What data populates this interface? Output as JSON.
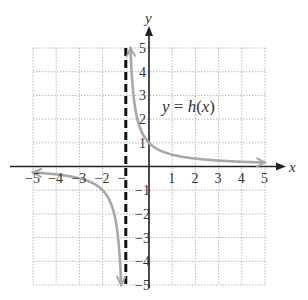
{
  "chart_data": {
    "type": "line",
    "title": "",
    "function_label": "y = h(x)",
    "xlabel": "x",
    "ylabel": "y",
    "xlim": [
      -5,
      5
    ],
    "ylim": [
      -5,
      5
    ],
    "grid": true,
    "grid_style": "dotted",
    "x_tick_labels": [
      "-5",
      "-4",
      "-3",
      "-2",
      "-",
      "1",
      "2",
      "3",
      "4",
      "5"
    ],
    "y_tick_labels": [
      "5",
      "4",
      "3",
      "2",
      "1",
      "-1",
      "-2",
      "-3",
      "-4",
      "-5"
    ],
    "vertical_asymptote": {
      "x": -1,
      "style": "dashed"
    },
    "horizontal_asymptote": {
      "y": 0
    },
    "series": [
      {
        "name": "h(x) right branch",
        "x": [
          -0.8,
          -0.7,
          -0.5,
          -0.25,
          0,
          0.5,
          1,
          2,
          3,
          4,
          5
        ],
        "y": [
          5,
          3.33,
          2,
          1.33,
          1,
          0.67,
          0.5,
          0.33,
          0.25,
          0.2,
          0.17
        ]
      },
      {
        "name": "h(x) left branch",
        "x": [
          -5,
          -4,
          -3,
          -2,
          -1.5,
          -1.25,
          -1.2
        ],
        "y": [
          -0.25,
          -0.33,
          -0.5,
          -1,
          -2,
          -4,
          -5
        ]
      }
    ],
    "colors": {
      "curve": "#a8a8a8",
      "axes": "#222222",
      "asymptote": "#111111",
      "grid": "#b8b8b8"
    }
  },
  "labels": {
    "x_axis": "x",
    "y_axis": "y",
    "function": "y = h(x)",
    "xticks": [
      {
        "v": -5,
        "t": "−5"
      },
      {
        "v": -4,
        "t": "−4"
      },
      {
        "v": -3,
        "t": "−3"
      },
      {
        "v": -2,
        "t": "−2"
      },
      {
        "v": -1,
        "t": "−"
      },
      {
        "v": 1,
        "t": "1"
      },
      {
        "v": 2,
        "t": "2"
      },
      {
        "v": 3,
        "t": "3"
      },
      {
        "v": 4,
        "t": "4"
      },
      {
        "v": 5,
        "t": "5"
      }
    ],
    "yticks": [
      {
        "v": 5,
        "t": "5"
      },
      {
        "v": 4,
        "t": "4"
      },
      {
        "v": 3,
        "t": "3"
      },
      {
        "v": 2,
        "t": "2"
      },
      {
        "v": 1,
        "t": "1"
      },
      {
        "v": -1,
        "t": "−1"
      },
      {
        "v": -2,
        "t": "−2"
      },
      {
        "v": -3,
        "t": "−3"
      },
      {
        "v": -4,
        "t": "−4"
      },
      {
        "v": -5,
        "t": "−5"
      }
    ]
  }
}
